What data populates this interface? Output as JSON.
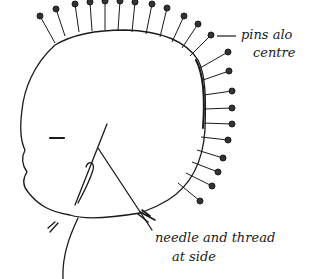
{
  "diagram": {
    "labels": {
      "pins_line1": "pins alo",
      "pins_line2": "centre",
      "needle_line1": "needle and thread",
      "needle_line2": "at side"
    },
    "colors": {
      "ink": "#1a1a1a",
      "paper": "#ffffff"
    }
  }
}
